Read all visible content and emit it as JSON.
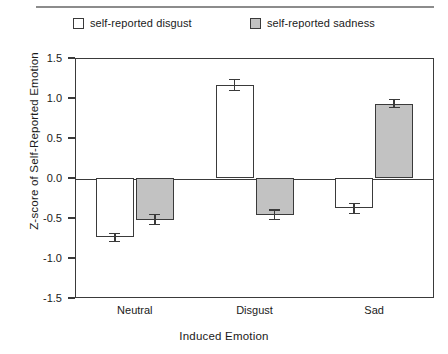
{
  "chart_data": {
    "type": "bar",
    "title": "",
    "xlabel": "Induced Emotion",
    "ylabel": "Z-score of Self-Reported Emotion",
    "categories": [
      "Neutral",
      "Disgust",
      "Sad"
    ],
    "ylim": [
      -1.5,
      1.5
    ],
    "yticks": [
      "1.5",
      "1.0",
      "0.5",
      "0.0",
      "-0.5",
      "-1.0",
      "-1.5"
    ],
    "ytick_values": [
      1.5,
      1.0,
      0.5,
      0.0,
      -0.5,
      -1.0,
      -1.5
    ],
    "grid": false,
    "legend_position": "top",
    "orientation": "vertical",
    "zero_line": true,
    "series": [
      {
        "name": "self-reported disgust",
        "color": "#ffffff",
        "edge_color": "#3a3a3a",
        "values": [
          -0.74,
          1.16,
          -0.38
        ],
        "errors": [
          0.05,
          0.07,
          0.06
        ]
      },
      {
        "name": "self-reported sadness",
        "color": "#c2c2c2",
        "edge_color": "#3a3a3a",
        "values": [
          -0.52,
          -0.46,
          0.93
        ],
        "errors": [
          0.06,
          0.06,
          0.05
        ]
      }
    ]
  },
  "legend": {
    "items": [
      {
        "label": "self-reported disgust",
        "swatch": "white"
      },
      {
        "label": "self-reported sadness",
        "swatch": "gray"
      }
    ]
  },
  "colors": {
    "axis": "#3a3a3a",
    "gray_fill": "#c2c2c2",
    "white_fill": "#ffffff",
    "rule": "#8c8c8c"
  }
}
